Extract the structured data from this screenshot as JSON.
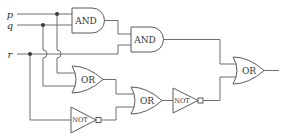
{
  "diagram": {
    "type": "logic-circuit",
    "inputs": [
      {
        "id": "p",
        "label": "p"
      },
      {
        "id": "q",
        "label": "q"
      },
      {
        "id": "r",
        "label": "r"
      }
    ],
    "gates": [
      {
        "id": "and1",
        "label": "AND",
        "inputs": [
          "p",
          "q"
        ]
      },
      {
        "id": "and2",
        "label": "AND",
        "inputs": [
          "and1",
          "r"
        ]
      },
      {
        "id": "or1",
        "label": "OR",
        "inputs": [
          "p",
          "q"
        ]
      },
      {
        "id": "not1",
        "label": "NOT",
        "inputs": [
          "r"
        ]
      },
      {
        "id": "or2",
        "label": "OR",
        "inputs": [
          "or1",
          "not1"
        ]
      },
      {
        "id": "not2",
        "label": "NOT",
        "inputs": [
          "or2"
        ]
      },
      {
        "id": "or3",
        "label": "OR",
        "inputs": [
          "and2",
          "not2"
        ]
      }
    ],
    "output": "or3"
  }
}
